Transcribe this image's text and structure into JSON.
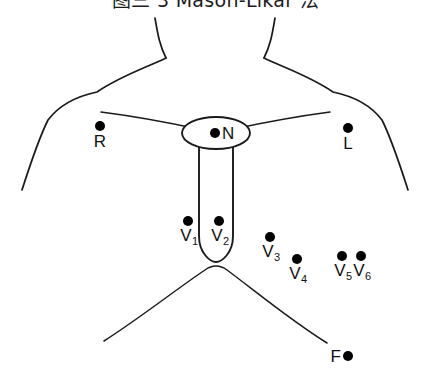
{
  "figure": {
    "title": "图三  3  Mason-Likar 法",
    "caption_visible": true,
    "background_color": "#ffffff",
    "stroke_color": "#1a1a1a",
    "marker_color": "#000000"
  },
  "diagram": {
    "type": "anatomical-electrode-placement",
    "anatomy_parts": [
      "neck",
      "left-shoulder",
      "right-shoulder",
      "left-torso-side",
      "right-torso-side",
      "left-clavicle",
      "right-clavicle",
      "suprasternal-notch",
      "sternum",
      "costal-margin"
    ]
  },
  "electrodes": [
    {
      "id": "R",
      "label": "R",
      "subscript": "",
      "x": 100,
      "y": 126,
      "label_position": "below",
      "name": "electrode-r"
    },
    {
      "id": "N",
      "label": "N",
      "subscript": "",
      "x": 215,
      "y": 133,
      "label_position": "right",
      "name": "electrode-n"
    },
    {
      "id": "L",
      "label": "L",
      "subscript": "",
      "x": 348,
      "y": 128,
      "label_position": "below",
      "name": "electrode-l"
    },
    {
      "id": "V1",
      "label": "V",
      "subscript": "1",
      "x": 188,
      "y": 221,
      "label_position": "vlead",
      "name": "electrode-v1"
    },
    {
      "id": "V2",
      "label": "V",
      "subscript": "2",
      "x": 219,
      "y": 221,
      "label_position": "vlead",
      "name": "electrode-v2"
    },
    {
      "id": "V3",
      "label": "V",
      "subscript": "3",
      "x": 270,
      "y": 237,
      "label_position": "vlead",
      "name": "electrode-v3"
    },
    {
      "id": "V4",
      "label": "V",
      "subscript": "4",
      "x": 297,
      "y": 259,
      "label_position": "vlead",
      "name": "electrode-v4"
    },
    {
      "id": "V5",
      "label": "V",
      "subscript": "5",
      "x": 342,
      "y": 256,
      "label_position": "vlead",
      "name": "electrode-v5"
    },
    {
      "id": "V6",
      "label": "V",
      "subscript": "6",
      "x": 361,
      "y": 256,
      "label_position": "vlead",
      "name": "electrode-v6"
    },
    {
      "id": "F",
      "label": "F",
      "subscript": "",
      "x": 348,
      "y": 356,
      "label_position": "left",
      "name": "electrode-f"
    }
  ]
}
